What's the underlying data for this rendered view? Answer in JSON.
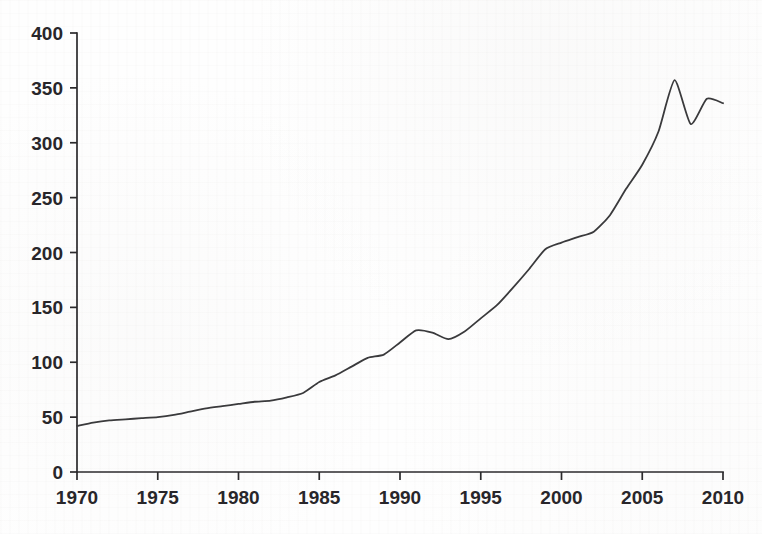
{
  "chart_data": {
    "type": "line",
    "title": "",
    "subtitle": "",
    "xlabel": "",
    "ylabel": "",
    "xlim": [
      1970,
      2010
    ],
    "ylim": [
      0,
      400
    ],
    "grid": false,
    "legend": false,
    "legend_position": "none",
    "line_color": "#3a3a3c",
    "axis_color": "#2b2a2c",
    "background_color": "#fefefe",
    "x_ticks": [
      1970,
      1975,
      1980,
      1985,
      1990,
      1995,
      2000,
      2005,
      2010
    ],
    "x_tick_labels": [
      "1970",
      "1975",
      "1980",
      "1985",
      "1990",
      "1995",
      "2000",
      "2005",
      "2010"
    ],
    "y_ticks": [
      0,
      50,
      100,
      150,
      200,
      250,
      300,
      350,
      400
    ],
    "y_tick_labels": [
      "0",
      "50",
      "100",
      "150",
      "200",
      "250",
      "300",
      "350",
      "400"
    ],
    "series": [
      {
        "name": "series-1",
        "x": [
          1970,
          1971,
          1972,
          1973,
          1974,
          1975,
          1976,
          1977,
          1978,
          1979,
          1980,
          1981,
          1982,
          1983,
          1984,
          1985,
          1986,
          1987,
          1988,
          1989,
          1990,
          1991,
          1992,
          1993,
          1994,
          1995,
          1996,
          1997,
          1998,
          1999,
          2000,
          2001,
          2002,
          2003,
          2004,
          2005,
          2006,
          2007,
          2008,
          2009,
          2010
        ],
        "values": [
          42,
          45,
          47,
          48,
          49,
          50,
          52,
          55,
          58,
          60,
          62,
          64,
          65,
          68,
          72,
          82,
          88,
          96,
          104,
          107,
          118,
          129,
          127,
          121,
          128,
          140,
          152,
          168,
          185,
          203,
          209,
          214,
          219,
          234,
          258,
          280,
          310,
          357,
          317,
          340,
          336
        ]
      }
    ]
  },
  "axes": {
    "y_axis_name": "value-axis",
    "x_axis_name": "year-axis"
  }
}
